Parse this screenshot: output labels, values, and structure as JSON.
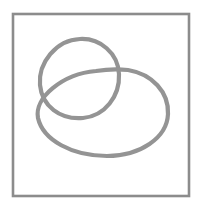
{
  "canvas": {
    "width": 199,
    "height": 211,
    "background_color": "#ffffff",
    "title": "Two interlocking loops inside a rectangular frame"
  },
  "frame": {
    "name": "border-rectangle",
    "x": 13,
    "y": 14,
    "width": 176,
    "height": 182,
    "stroke_color": "#8c8c8c",
    "stroke_width": 2.6,
    "fill": "none"
  },
  "shapes": [
    {
      "name": "upper-left-loop",
      "type": "closed-curve",
      "style": "hand-drawn",
      "stroke_color": "#949494",
      "stroke_width": 4.2,
      "fill": "none",
      "bounds": {
        "left": 40,
        "top": 38,
        "right": 120,
        "bottom": 120
      },
      "center": {
        "x": 80,
        "y": 79
      },
      "path": "M 80 39 C 100 38 118 53 119 74 C 120 96 105 116 83 118 C 60 120 42 106 40 85 C 38 63 56 40 80 39 Z"
    },
    {
      "name": "lower-right-loop",
      "type": "closed-curve",
      "style": "hand-drawn",
      "stroke_color": "#949494",
      "stroke_width": 4.2,
      "fill": "none",
      "bounds": {
        "left": 38,
        "top": 69,
        "right": 169,
        "bottom": 158
      },
      "center": {
        "x": 103,
        "y": 113
      },
      "path": "M 128 70 C 152 74 169 92 168 114 C 167 138 140 156 107 156 C 72 156 43 140 38 118 C 34 98 62 74 96 71 C 108 69 119 69 128 70 Z"
    }
  ],
  "intersections": [
    {
      "name": "crossing-left",
      "x": 46,
      "y": 92
    },
    {
      "name": "crossing-right",
      "x": 114,
      "y": 73
    }
  ],
  "colors": {
    "stroke": "#949494",
    "frame": "#8c8c8c",
    "background": "#ffffff"
  },
  "labels": {
    "figure_caption": ""
  }
}
